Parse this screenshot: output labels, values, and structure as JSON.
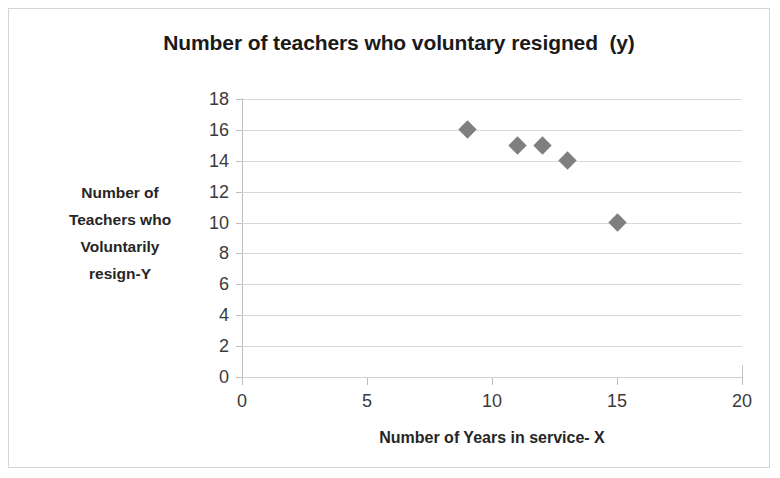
{
  "chart_data": {
    "type": "scatter",
    "title": "Number of teachers who voluntary resigned  (y)",
    "xlabel": "Number of Years in service- X",
    "ylabel": "Number of Teachers who Voluntarily resign-Y",
    "ylabel_lines": [
      "Number of",
      "Teachers who",
      "Voluntarily",
      "resign-Y"
    ],
    "xlim": [
      0,
      20
    ],
    "ylim": [
      0,
      18
    ],
    "xticks": [
      0,
      5,
      10,
      15,
      20
    ],
    "yticks": [
      0,
      2,
      4,
      6,
      8,
      10,
      12,
      14,
      16,
      18
    ],
    "grid": "horizontal",
    "legend": "none",
    "marker_shape": "diamond",
    "marker_color": "#7f7f7f",
    "series": [
      {
        "name": "Teachers who voluntarily resigned",
        "points": [
          {
            "x": 9,
            "y": 16
          },
          {
            "x": 11,
            "y": 15
          },
          {
            "x": 12,
            "y": 15
          },
          {
            "x": 13,
            "y": 14
          },
          {
            "x": 15,
            "y": 10
          }
        ]
      }
    ]
  },
  "colors": {
    "marker": "#7f7f7f",
    "gridline": "#d9d9d9",
    "axis": "#bdbdbd",
    "border": "#d5d5d5",
    "text": "#262626"
  }
}
